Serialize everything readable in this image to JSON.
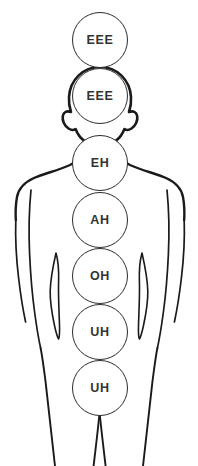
{
  "diagram": {
    "background_color": "#ffffff",
    "outline_color": "#1a1a1a",
    "circle_stroke_color": "#2b2b2b",
    "label_color": "#333333",
    "figure": {
      "name": "human-body-outline",
      "view": "frontal silhouette, legs cropped at bottom edge"
    },
    "resonance_points": [
      {
        "label": "EEE",
        "location": "above-head",
        "cx": 100,
        "cy": 40,
        "r": 28
      },
      {
        "label": "EEE",
        "location": "head",
        "cx": 100,
        "cy": 96,
        "r": 28
      },
      {
        "label": "EH",
        "location": "throat-neck",
        "cx": 100,
        "cy": 163,
        "r": 28
      },
      {
        "label": "AH",
        "location": "chest",
        "cx": 100,
        "cy": 220,
        "r": 28
      },
      {
        "label": "OH",
        "location": "abdomen",
        "cx": 100,
        "cy": 276,
        "r": 28
      },
      {
        "label": "UH",
        "location": "lower-abdomen",
        "cx": 100,
        "cy": 332,
        "r": 28
      },
      {
        "label": "UH",
        "location": "pelvis",
        "cx": 100,
        "cy": 388,
        "r": 28
      }
    ]
  }
}
